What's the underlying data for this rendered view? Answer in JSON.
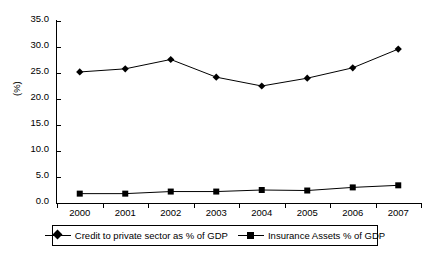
{
  "chart_data": {
    "type": "line",
    "title": "",
    "xlabel": "",
    "ylabel": "(%)",
    "categories": [
      "2000",
      "2001",
      "2002",
      "2003",
      "2004",
      "2005",
      "2006",
      "2007"
    ],
    "ylim": [
      0.0,
      35.0
    ],
    "ytick_step": 5.0,
    "yticks": [
      "35.0",
      "30.0",
      "25.0",
      "20.0",
      "15.0",
      "10.0",
      "5.0",
      "0.0"
    ],
    "grid": false,
    "legend_position": "below-plot",
    "series": [
      {
        "name": "Credit to private sector as % of GDP",
        "marker": "diamond",
        "color": "#000000",
        "values": [
          25.2,
          25.8,
          27.6,
          24.2,
          22.5,
          24.0,
          26.0,
          29.6
        ]
      },
      {
        "name": "Insurance Assets % of GDP",
        "marker": "square",
        "color": "#000000",
        "values": [
          1.8,
          1.8,
          2.2,
          2.2,
          2.5,
          2.4,
          3.0,
          3.4
        ]
      }
    ]
  },
  "legend": {
    "entries": [
      {
        "label": "Credit to private sector as % of GDP",
        "marker": "diamond"
      },
      {
        "label": "Insurance Assets % of GDP",
        "marker": "square"
      }
    ]
  },
  "colors": {
    "axis": "#000000",
    "series": "#000000",
    "background": "#ffffff"
  }
}
